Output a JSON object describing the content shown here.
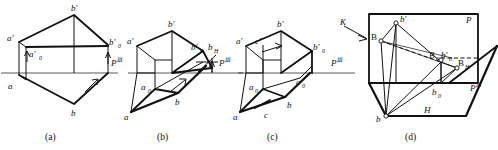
{
  "figure": {
    "ground_line_label": "P",
    "ground_line_sup": "Ⅲ",
    "panels": [
      {
        "id": "a",
        "caption": "(a)",
        "labels": [
          {
            "name": "a-prime",
            "base": "a",
            "prime": "′",
            "sub": ""
          },
          {
            "name": "a-prime-zero",
            "base": "a",
            "prime": "′",
            "sub": "0"
          },
          {
            "name": "b-prime",
            "base": "b",
            "prime": "′",
            "sub": ""
          },
          {
            "name": "b-prime-zero",
            "base": "b",
            "prime": "′",
            "sub": "0"
          },
          {
            "name": "a",
            "base": "a",
            "prime": "",
            "sub": ""
          },
          {
            "name": "b",
            "base": "b",
            "prime": "",
            "sub": ""
          },
          {
            "name": "ground-line",
            "base": "P",
            "prime": "",
            "sub": ""
          }
        ]
      },
      {
        "id": "b",
        "caption": "(b)",
        "labels": [
          {
            "name": "a-prime",
            "base": "a",
            "prime": "′",
            "sub": ""
          },
          {
            "name": "a-zero",
            "base": "a",
            "prime": "",
            "sub": "0"
          },
          {
            "name": "b-prime",
            "base": "b",
            "prime": "′",
            "sub": ""
          },
          {
            "name": "b-prime-zero",
            "base": "b",
            "prime": "′",
            "sub": "0"
          },
          {
            "name": "b-h",
            "base": "b",
            "prime": "",
            "sub": "H"
          },
          {
            "name": "a",
            "base": "a",
            "prime": "",
            "sub": ""
          },
          {
            "name": "b",
            "base": "b",
            "prime": "",
            "sub": ""
          },
          {
            "name": "ground-line",
            "base": "P",
            "prime": "",
            "sub": ""
          }
        ]
      },
      {
        "id": "c",
        "caption": "(c)",
        "labels": [
          {
            "name": "a-prime",
            "base": "a",
            "prime": "′",
            "sub": ""
          },
          {
            "name": "c-prime",
            "base": "c",
            "prime": "′",
            "sub": ""
          },
          {
            "name": "b-prime",
            "base": "b",
            "prime": "′",
            "sub": ""
          },
          {
            "name": "b-prime-zero",
            "base": "b",
            "prime": "′",
            "sub": "0"
          },
          {
            "name": "a-zero",
            "base": "a",
            "prime": "",
            "sub": "0"
          },
          {
            "name": "c-zero",
            "base": "c",
            "prime": "",
            "sub": "0"
          },
          {
            "name": "a",
            "base": "a",
            "prime": "",
            "sub": ""
          },
          {
            "name": "b",
            "base": "b",
            "prime": "",
            "sub": ""
          },
          {
            "name": "c",
            "base": "c",
            "prime": "",
            "sub": ""
          },
          {
            "name": "ground-line",
            "base": "P",
            "prime": "",
            "sub": ""
          }
        ]
      },
      {
        "id": "d",
        "caption": "(d)",
        "labels": [
          {
            "name": "direction-k",
            "base": "K",
            "prime": "",
            "sub": ""
          },
          {
            "name": "plane-p",
            "base": "P",
            "prime": "",
            "sub": ""
          },
          {
            "name": "plane-h",
            "base": "H",
            "prime": "",
            "sub": ""
          },
          {
            "name": "b-prime",
            "base": "b",
            "prime": "′",
            "sub": ""
          },
          {
            "name": "point-B",
            "base": "B",
            "prime": "",
            "sub": ""
          },
          {
            "name": "point-B-zero",
            "base": "B",
            "prime": "",
            "sub": "0"
          },
          {
            "name": "b-prime-zero",
            "base": "b",
            "prime": "′",
            "sub": "0"
          },
          {
            "name": "point-B-H",
            "base": "B",
            "prime": "",
            "sub": "H"
          },
          {
            "name": "b-zero",
            "base": "b",
            "prime": "",
            "sub": "0"
          },
          {
            "name": "b",
            "base": "b",
            "prime": "",
            "sub": ""
          },
          {
            "name": "ground-line",
            "base": "P",
            "prime": "",
            "sub": ""
          }
        ]
      }
    ],
    "text": {
      "a_prime": "a′",
      "a_prime_zero_base": "a′",
      "zero": "0",
      "b_prime": "b′",
      "b_prime_zero_base": "b′",
      "a": "a",
      "b": "b",
      "c": "c",
      "c_prime": "c′",
      "a_zero_base": "a",
      "c_zero_base": "c",
      "b_zero_base": "b",
      "b_h_base": "b",
      "h_sub": "H",
      "P": "P",
      "P_sup": "Ⅲ",
      "K": "K",
      "H": "H",
      "B": "B",
      "cap_a": "(a)",
      "cap_b": "(b)",
      "cap_c": "(c)",
      "cap_d": "(d)"
    },
    "colors": {
      "ink": "#111111",
      "paper": "#ffffff"
    }
  }
}
